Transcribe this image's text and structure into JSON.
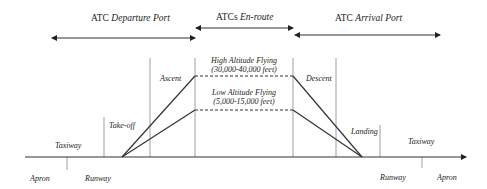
{
  "headers": {
    "departure": {
      "prefix": "ATC ",
      "italic": "Departure Port"
    },
    "enroute": {
      "prefix": "ATCs ",
      "italic": "En-route"
    },
    "arrival": {
      "prefix": "ATC ",
      "italic": "Arrival Port"
    }
  },
  "phases": {
    "ascent": "Ascent",
    "descent": "Descent",
    "takeoff": "Take-off",
    "landing": "Landing",
    "taxiway_left": "Taxiway",
    "taxiway_right": "Taxiway",
    "apron_left": "Apron",
    "apron_right": "Apron",
    "runway_left": "Runway",
    "runway_right": "Runway"
  },
  "altitudes": {
    "high": {
      "label": "High Altitude Flying",
      "range": "(30,000-40,000 feet)"
    },
    "low": {
      "label": "Low Altitude Flying",
      "range": "(5,000-15,000 feet)"
    }
  },
  "colors": {
    "line": "#2a2a2a",
    "divider": "#777777"
  }
}
